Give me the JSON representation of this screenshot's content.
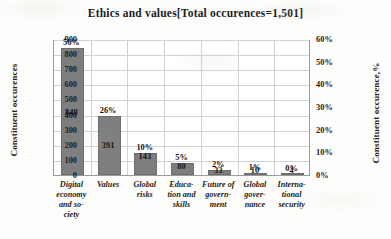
{
  "chart_data": {
    "type": "bar",
    "title": "Ethics and values[Total occurences=1,501]",
    "xlabel": "",
    "ylabel": "Constituent occurences",
    "y2label": "Constituent occurence,%",
    "ylim": [
      0,
      900
    ],
    "y2lim": [
      0,
      60
    ],
    "grid": true,
    "legend": null,
    "categories": [
      "Digital\neconomy\nand so-\nciety",
      "Values",
      "Global\nrisks",
      "Educa-\ntion and\nskills",
      "Future of\ngovern-\nment",
      "Global\ngover-\nnance",
      "Interna-\ntional\nsecurity"
    ],
    "values": [
      840,
      391,
      143,
      80,
      33,
      10,
      4
    ],
    "percent_labels": [
      "56%",
      "26%",
      "10%",
      "5%",
      "2%",
      "1%",
      "0%"
    ],
    "value_labels": [
      "840",
      "391",
      "143",
      "80",
      "33",
      "10",
      "4"
    ],
    "yticks": [
      0,
      100,
      200,
      300,
      400,
      500,
      600,
      700,
      800,
      900
    ],
    "ytick_labels": [
      "0",
      "100",
      "200",
      "300",
      "400",
      "500",
      "600",
      "700",
      "800",
      "900"
    ],
    "y2ticks": [
      0,
      10,
      20,
      30,
      40,
      50,
      60
    ],
    "y2tick_labels": [
      "0%",
      "10%",
      "20%",
      "30%",
      "40%",
      "50%",
      "60%"
    ],
    "total_occurrences": "1,501",
    "bar_color": "#7e7e7e"
  }
}
